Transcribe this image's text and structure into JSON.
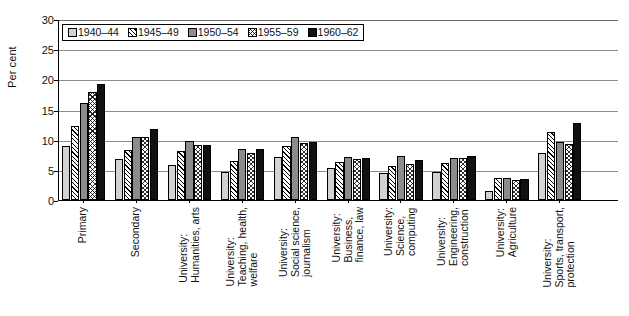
{
  "chart_data": {
    "type": "bar",
    "title": "",
    "xlabel": "",
    "ylabel": "Per cent",
    "ylim": [
      0,
      30
    ],
    "yticks": [
      0,
      5,
      10,
      15,
      20,
      25,
      30
    ],
    "grid": "horizontal",
    "legend_position": "top-left-inside",
    "categories": [
      "Primary",
      "Secondary",
      "University: Humanities, arts",
      "University: Teaching, health, welfare",
      "University: Social science, journalism",
      "University: Business, finance, law",
      "University: Science, computing",
      "University: Engineering, construction",
      "University: Agriculture",
      "University: Sports, transport, protection"
    ],
    "category_lines": [
      [
        "Primary"
      ],
      [
        "Secondary"
      ],
      [
        "University:",
        "Humanities, arts"
      ],
      [
        "University:",
        "Teaching, health,",
        "welfare"
      ],
      [
        "University:",
        "Social science,",
        "journalism"
      ],
      [
        "University:",
        "Business,",
        "finance, law"
      ],
      [
        "University:",
        "Science,",
        "computing"
      ],
      [
        "University:",
        "Engineering,",
        "construction"
      ],
      [
        "University:",
        "Agriculture"
      ],
      [
        "University:",
        "Sports, transport,",
        "protection"
      ]
    ],
    "series": [
      {
        "name": "1940–44",
        "fill": "light-grey-solid",
        "color": "#d2d2d2",
        "values": [
          8.9,
          6.8,
          5.8,
          4.6,
          7.2,
          5.3,
          4.4,
          4.7,
          1.5,
          7.8
        ]
      },
      {
        "name": "1945–49",
        "fill": "diagonal-hatch",
        "color": "#ffffff",
        "values": [
          12.2,
          8.3,
          8.2,
          6.5,
          8.9,
          6.3,
          5.6,
          6.1,
          3.6,
          11.3
        ]
      },
      {
        "name": "1950–54",
        "fill": "dark-grey-solid",
        "color": "#8c8c8c",
        "values": [
          16.1,
          10.4,
          9.8,
          8.5,
          10.5,
          7.2,
          7.3,
          6.9,
          3.7,
          9.6
        ]
      },
      {
        "name": "1955–59",
        "fill": "cross-hatch",
        "color": "#ffffff",
        "values": [
          17.9,
          10.5,
          9.1,
          7.8,
          9.5,
          6.8,
          6.0,
          7.0,
          3.4,
          9.3
        ]
      },
      {
        "name": "1960–62",
        "fill": "black-solid",
        "color": "#111111",
        "values": [
          19.3,
          11.8,
          9.2,
          8.4,
          9.6,
          7.0,
          6.7,
          7.3,
          3.5,
          12.7
        ]
      }
    ]
  }
}
